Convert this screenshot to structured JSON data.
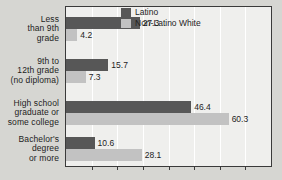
{
  "chart_data": {
    "type": "bar",
    "orientation": "horizontal",
    "title": "",
    "subtitle": "",
    "xlabel": "",
    "ylabel": "",
    "categories": [
      "Less\nthan 9th\ngrade",
      "9th to\n12th grade\n(no diploma)",
      "High school\ngraduate or\nsome college",
      "Bachelor's\ndegree\nor more"
    ],
    "series": [
      {
        "name": "Latino",
        "color": "#575757",
        "values": [
          27.3,
          15.7,
          46.4,
          10.6
        ],
        "value_labels": [
          "27.3",
          "15.7",
          "46.4",
          "10.6"
        ]
      },
      {
        "name": "Non-Latino White",
        "color": "#c2c2c2",
        "values": [
          4.2,
          7.3,
          60.3,
          28.1
        ],
        "value_labels": [
          "4.2",
          "7.3",
          "60.3",
          "28.1"
        ]
      }
    ],
    "xlim": [
      0,
      76
    ],
    "ylim": null,
    "grid": true,
    "gridline_interval": 9.5,
    "xtick_labels": [],
    "legend_position": "top-right",
    "plot_background": "#efefed",
    "page_background": "#d6d6d2"
  }
}
